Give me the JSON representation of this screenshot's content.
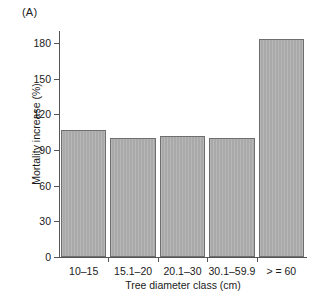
{
  "panel": {
    "label": "(A)"
  },
  "chart_data": {
    "type": "bar",
    "title": "",
    "subtitle": "",
    "xlabel": "Tree diameter class (cm)",
    "ylabel": "Mortality increase (%)",
    "categories": [
      "10–15",
      "15.1–20",
      "20.1–30",
      "30.1–59.9",
      "> = 60"
    ],
    "values": [
      107,
      100,
      102,
      100,
      183
    ],
    "series": [
      {
        "name": "Mortality increase",
        "values": [
          107,
          100,
          102,
          100,
          183
        ]
      }
    ],
    "ylim": [
      0,
      190
    ],
    "yticks": [
      0,
      30,
      60,
      90,
      120,
      150,
      180
    ],
    "ytick_labels": [
      "0",
      "30",
      "60",
      "90",
      "120",
      "150",
      "180"
    ],
    "xlim": [
      0,
      5
    ],
    "grid": false,
    "legend": false,
    "legend_position": "none",
    "bar_color": "#a9a9a9",
    "bar_edge_color": "#6e6e6e",
    "axis_color": "#555555",
    "text_color": "#1a1a1a",
    "background_color": "#ffffff"
  }
}
